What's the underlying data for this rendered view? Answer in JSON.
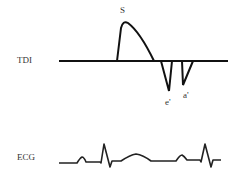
{
  "diagram": {
    "title": "",
    "line_color": "#111111",
    "text_color": "#333333",
    "tdi": {
      "label": "TDI",
      "waves": [
        {
          "name": "S",
          "label": "S",
          "direction": "positive"
        },
        {
          "name": "e'",
          "label": "e'",
          "direction": "negative"
        },
        {
          "name": "a'",
          "label": "a'",
          "direction": "negative"
        }
      ]
    },
    "ecg": {
      "label": "ECG"
    }
  }
}
